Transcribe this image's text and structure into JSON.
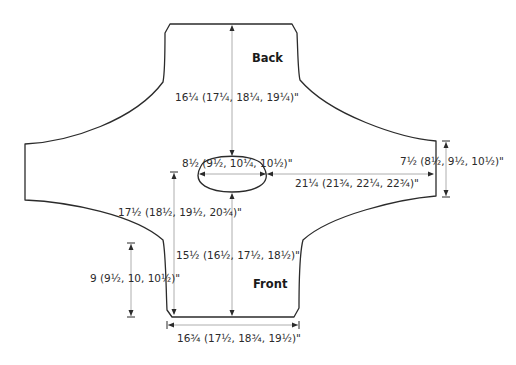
{
  "diagram": {
    "type": "knitting-schematic",
    "pieces": {
      "back": "Back",
      "front": "Front"
    },
    "measurements": {
      "back_length": "16¼ (17¼, 18¼, 19¼)\"",
      "neck_width": "8½ (9½, 10¼, 10½)\"",
      "cuff_width": "7½ (8½, 9½, 10½)\"",
      "sleeve_length": "21¼ (21¾, 22¼, 22¾)\"",
      "front_total_length": "17½ (18½, 19½, 20¾)\"",
      "front_length": "15½ (16½, 17½, 18½)\"",
      "side_length": "9 (9½, 10, 10½)\"",
      "hem_width": "16¾ (17½, 18¾, 19½)\""
    },
    "colors": {
      "outline": "#2b2b2b",
      "dimension_line": "#9a9a9a",
      "background": "#ffffff"
    }
  }
}
